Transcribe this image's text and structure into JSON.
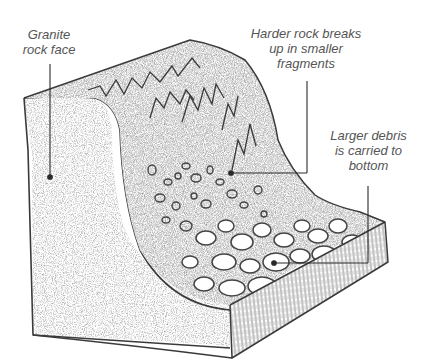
{
  "diagram": {
    "type": "geology-illustration",
    "colors": {
      "ink": "#3a3a3a",
      "leader_line": "#2a2a2a",
      "label_text": "#555555",
      "shading": "#9a9a9a",
      "background": "#ffffff"
    },
    "labels": [
      {
        "id": "granite",
        "lines": [
          "Granite",
          "rock face"
        ]
      },
      {
        "id": "harder",
        "lines": [
          "Harder rock breaks",
          "up in smaller",
          "fragments"
        ]
      },
      {
        "id": "larger",
        "lines": [
          "Larger debris",
          "is carried to",
          "bottom"
        ]
      }
    ]
  }
}
